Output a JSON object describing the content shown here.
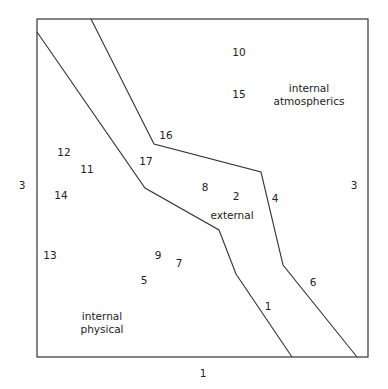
{
  "diagram": {
    "frame": {
      "left": 37,
      "top": 19,
      "right": 368,
      "bottom": 357,
      "stroke": "#333333"
    },
    "boundaries": [
      {
        "name": "lower-boundary",
        "points": [
          [
            37,
            32
          ],
          [
            145,
            188
          ],
          [
            219,
            230
          ],
          [
            236,
            274
          ],
          [
            292,
            357
          ]
        ]
      },
      {
        "name": "upper-boundary",
        "points": [
          [
            91,
            19
          ],
          [
            154,
            144
          ],
          [
            261,
            172
          ],
          [
            283,
            265
          ],
          [
            357,
            357
          ]
        ]
      }
    ],
    "regions": [
      {
        "id": "internal-atmospherics",
        "lines": [
          "internal",
          "atmospherics"
        ],
        "x": 309,
        "y": 95
      },
      {
        "id": "external",
        "lines": [
          "external"
        ],
        "x": 232,
        "y": 215
      },
      {
        "id": "internal-physical",
        "lines": [
          "internal",
          "physical"
        ],
        "x": 102,
        "y": 323
      }
    ],
    "points": [
      {
        "label": "1",
        "x": 268,
        "y": 306
      },
      {
        "label": "2",
        "x": 236,
        "y": 196
      },
      {
        "label": "4",
        "x": 275,
        "y": 198
      },
      {
        "label": "5",
        "x": 144,
        "y": 280
      },
      {
        "label": "6",
        "x": 313,
        "y": 282
      },
      {
        "label": "7",
        "x": 179,
        "y": 263
      },
      {
        "label": "8",
        "x": 205,
        "y": 187
      },
      {
        "label": "9",
        "x": 158,
        "y": 255
      },
      {
        "label": "10",
        "x": 239,
        "y": 52
      },
      {
        "label": "11",
        "x": 87,
        "y": 169
      },
      {
        "label": "12",
        "x": 64,
        "y": 152
      },
      {
        "label": "13",
        "x": 50,
        "y": 255
      },
      {
        "label": "14",
        "x": 61,
        "y": 195
      },
      {
        "label": "15",
        "x": 239,
        "y": 94
      },
      {
        "label": "16",
        "x": 166,
        "y": 135
      },
      {
        "label": "17",
        "x": 146,
        "y": 161
      }
    ],
    "axis_labels": [
      {
        "id": "left-axis-label",
        "label": "3",
        "x": 22,
        "y": 185
      },
      {
        "id": "right-axis-label",
        "label": "3",
        "x": 354,
        "y": 185
      },
      {
        "id": "bottom-axis-label",
        "label": "1",
        "x": 203,
        "y": 373
      }
    ]
  }
}
